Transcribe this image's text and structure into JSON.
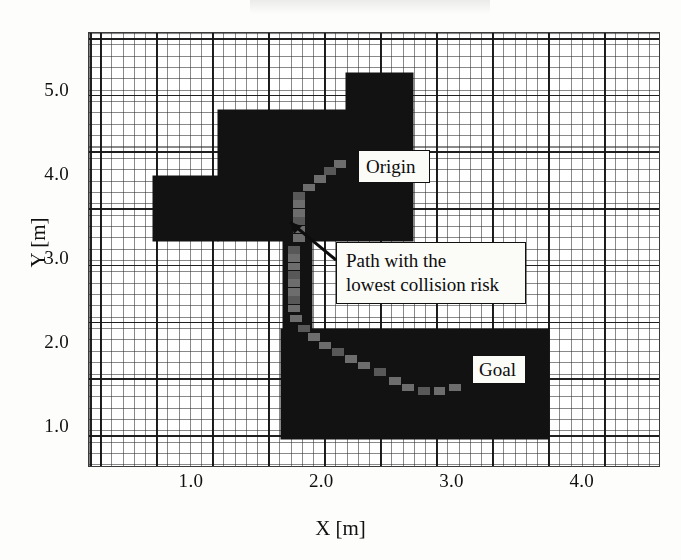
{
  "figure": {
    "type": "occupancy-grid-path-plot",
    "background_color": "#fdfdfb",
    "obstacle_color": "#121212",
    "path_color": "#6d6d6d"
  },
  "axes": {
    "x": {
      "label": "X [m]",
      "ticks": [
        "1.0",
        "2.0",
        "3.0",
        "4.0"
      ],
      "tick_values": [
        1.0,
        2.0,
        3.0,
        4.0
      ],
      "range": [
        0.21,
        4.6
      ]
    },
    "y": {
      "label": "Y [m]",
      "ticks": [
        "5.0",
        "4.0",
        "3.0",
        "2.0",
        "1.0"
      ],
      "tick_values": [
        5.0,
        4.0,
        3.0,
        2.0,
        1.0
      ],
      "range": [
        0.52,
        5.7
      ]
    }
  },
  "annotations": {
    "origin": {
      "label": "Origin"
    },
    "goal": {
      "label": "Goal"
    },
    "path": {
      "line1": "Path with the",
      "line2": "lowest collision risk"
    }
  },
  "chart_data": {
    "type": "heatmap",
    "title": "",
    "xlabel": "X [m]",
    "ylabel": "Y [m]",
    "xlim": [
      0.21,
      4.6
    ],
    "ylim": [
      0.52,
      5.7
    ],
    "grid": true,
    "legend": null,
    "cell_size_m": 0.1,
    "obstacles": [
      {
        "name": "top-tower",
        "x0": 2.18,
        "y0": 4.78,
        "x1": 2.7,
        "y1": 5.22
      },
      {
        "name": "upper-main-block",
        "x0": 1.2,
        "y0": 3.22,
        "x1": 2.7,
        "y1": 4.78
      },
      {
        "name": "upper-left-wing",
        "x0": 0.7,
        "y0": 3.22,
        "x1": 1.2,
        "y1": 4.0
      },
      {
        "name": "center-corridor-wall",
        "x0": 1.7,
        "y0": 2.18,
        "x1": 1.92,
        "y1": 3.22
      },
      {
        "name": "lower-main-block",
        "x0": 1.68,
        "y0": 0.86,
        "x1": 3.74,
        "y1": 2.18
      }
    ],
    "path_cells": [
      {
        "x": 2.14,
        "y": 4.14
      },
      {
        "x": 2.06,
        "y": 4.06
      },
      {
        "x": 1.98,
        "y": 3.96
      },
      {
        "x": 1.9,
        "y": 3.86
      },
      {
        "x": 1.82,
        "y": 3.76
      },
      {
        "x": 1.82,
        "y": 3.66
      },
      {
        "x": 1.82,
        "y": 3.56
      },
      {
        "x": 1.82,
        "y": 3.46
      },
      {
        "x": 1.82,
        "y": 3.36
      },
      {
        "x": 1.82,
        "y": 3.26
      },
      {
        "x": 1.78,
        "y": 3.12
      },
      {
        "x": 1.78,
        "y": 3.02
      },
      {
        "x": 1.78,
        "y": 2.92
      },
      {
        "x": 1.78,
        "y": 2.82
      },
      {
        "x": 1.78,
        "y": 2.72
      },
      {
        "x": 1.78,
        "y": 2.62
      },
      {
        "x": 1.78,
        "y": 2.52
      },
      {
        "x": 1.78,
        "y": 2.42
      },
      {
        "x": 1.8,
        "y": 2.3
      },
      {
        "x": 1.86,
        "y": 2.18
      },
      {
        "x": 1.94,
        "y": 2.08
      },
      {
        "x": 2.02,
        "y": 1.98
      },
      {
        "x": 2.12,
        "y": 1.9
      },
      {
        "x": 2.22,
        "y": 1.82
      },
      {
        "x": 2.32,
        "y": 1.74
      },
      {
        "x": 2.44,
        "y": 1.66
      },
      {
        "x": 2.56,
        "y": 1.56
      },
      {
        "x": 2.66,
        "y": 1.48
      },
      {
        "x": 2.78,
        "y": 1.44
      },
      {
        "x": 2.9,
        "y": 1.44
      },
      {
        "x": 3.02,
        "y": 1.48
      }
    ],
    "origin_point": {
      "x": 2.16,
      "y": 4.16
    },
    "goal_point": {
      "x": 3.04,
      "y": 1.48
    }
  }
}
